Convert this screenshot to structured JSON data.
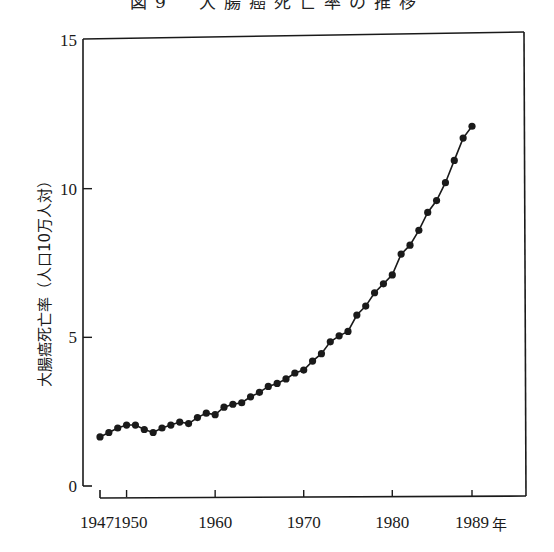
{
  "title": "図9　大腸癌死亡率の推移",
  "chart_data": {
    "type": "line",
    "title": "図9　大腸癌死亡率の推移",
    "xlabel": "年",
    "ylabel": "大腸癌死亡率（人口10万人対）",
    "x_ticks": [
      1947,
      1950,
      1960,
      1970,
      1980,
      1989
    ],
    "x_tick_labels": [
      "1947",
      "1950",
      "1960",
      "1970",
      "1980",
      "1989"
    ],
    "y_ticks": [
      0,
      5,
      10,
      15
    ],
    "y_tick_labels": [
      "0",
      "5",
      "10",
      "15"
    ],
    "xlim": [
      1947,
      1989
    ],
    "ylim": [
      0,
      15
    ],
    "grid": false,
    "legend": null,
    "marker": "filled-circle",
    "line_color": "#1a1a1a",
    "x": [
      1947,
      1948,
      1949,
      1950,
      1951,
      1952,
      1953,
      1954,
      1955,
      1956,
      1957,
      1958,
      1959,
      1960,
      1961,
      1962,
      1963,
      1964,
      1965,
      1966,
      1967,
      1968,
      1969,
      1970,
      1971,
      1972,
      1973,
      1974,
      1975,
      1976,
      1977,
      1978,
      1979,
      1980,
      1981,
      1982,
      1983,
      1984,
      1985,
      1986,
      1987,
      1988,
      1989
    ],
    "values": [
      1.65,
      1.8,
      1.95,
      2.05,
      2.05,
      1.9,
      1.8,
      1.95,
      2.05,
      2.15,
      2.1,
      2.3,
      2.45,
      2.4,
      2.65,
      2.75,
      2.8,
      3.0,
      3.15,
      3.35,
      3.45,
      3.6,
      3.8,
      3.9,
      4.2,
      4.45,
      4.85,
      5.05,
      5.2,
      5.75,
      6.05,
      6.5,
      6.8,
      7.1,
      7.8,
      8.1,
      8.6,
      9.2,
      9.6,
      10.2,
      10.95,
      11.7,
      12.1
    ]
  }
}
